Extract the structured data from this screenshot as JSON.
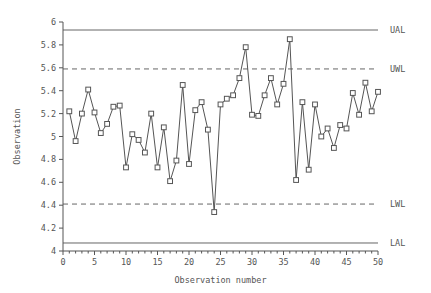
{
  "chart_data": {
    "type": "line",
    "title": "",
    "xlabel": "Observation number",
    "ylabel": "Observation",
    "xlim": [
      0,
      50
    ],
    "ylim": [
      4,
      6
    ],
    "x_ticks": [
      0,
      5,
      10,
      15,
      20,
      25,
      30,
      35,
      40,
      45,
      50
    ],
    "x_minor_tick_step": 1,
    "y_ticks": [
      4,
      4.2,
      4.4,
      4.6,
      4.8,
      5,
      5.2,
      5.4,
      5.6,
      5.8,
      6
    ],
    "y_tick_labels": [
      "4",
      "4.2",
      "4.4",
      "4.6",
      "4.8",
      "5",
      "5.2",
      "5.4",
      "5.6",
      "5.8",
      "6"
    ],
    "grid": false,
    "legend_position": "right-outside",
    "series": [
      {
        "name": "Observation",
        "marker": "square",
        "color": "#555555",
        "x": [
          1,
          2,
          3,
          4,
          5,
          6,
          7,
          8,
          9,
          10,
          11,
          12,
          13,
          14,
          15,
          16,
          17,
          18,
          19,
          20,
          21,
          22,
          23,
          24,
          25,
          26,
          27,
          28,
          29,
          30,
          31,
          32,
          33,
          34,
          35,
          36,
          37,
          38,
          39,
          40,
          41,
          42,
          43,
          44,
          45,
          46,
          47,
          48,
          49,
          50
        ],
        "values": [
          5.22,
          4.96,
          5.2,
          5.41,
          5.21,
          5.03,
          5.11,
          5.26,
          5.27,
          4.73,
          5.02,
          4.97,
          4.86,
          5.2,
          4.73,
          5.08,
          4.61,
          4.79,
          5.45,
          4.76,
          5.23,
          5.3,
          5.06,
          4.34,
          5.28,
          5.33,
          5.36,
          5.51,
          5.78,
          5.19,
          5.18,
          5.36,
          5.51,
          5.28,
          5.46,
          5.85,
          4.62,
          5.3,
          4.71,
          5.28,
          5.0,
          5.07,
          4.9,
          5.1,
          5.07,
          5.38,
          5.19,
          5.47,
          5.22,
          5.39
        ]
      }
    ],
    "control_limits": [
      {
        "id": "UAL",
        "label": "UAL",
        "value": 5.93,
        "style": "solid",
        "color": "#666666"
      },
      {
        "id": "UWL",
        "label": "UWL",
        "value": 5.59,
        "style": "dashed",
        "color": "#666666"
      },
      {
        "id": "LWL",
        "label": "LWL",
        "value": 4.41,
        "style": "dashed",
        "color": "#666666"
      },
      {
        "id": "LAL",
        "label": "LAL",
        "value": 4.07,
        "style": "solid",
        "color": "#666666"
      }
    ],
    "axis_color": "#555555",
    "line_color": "#555555",
    "background_color": "#ffffff"
  }
}
